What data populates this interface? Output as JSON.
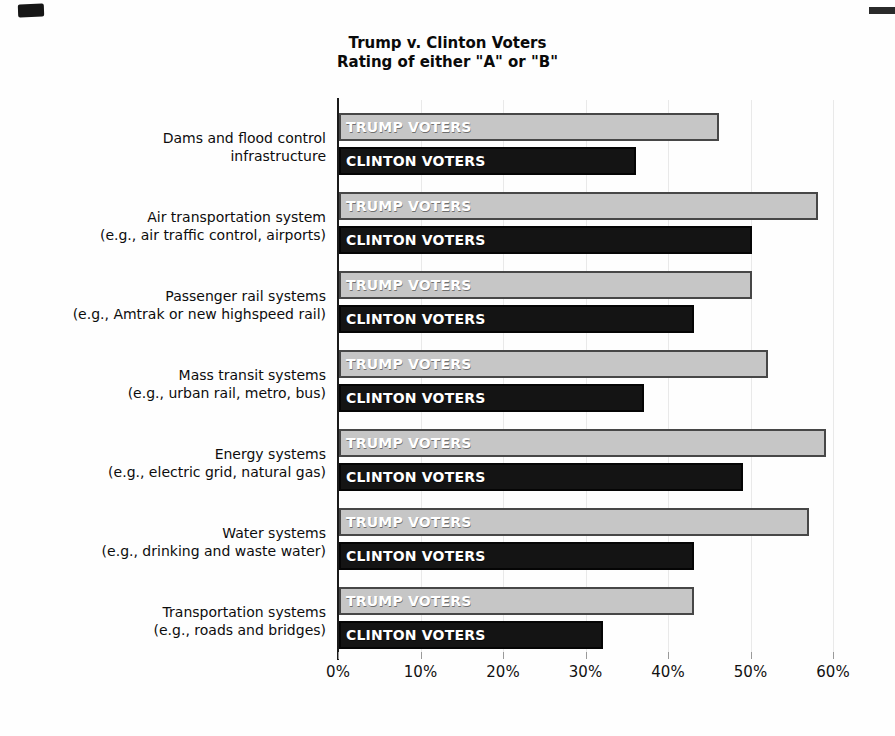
{
  "page": {
    "background": "#fefefe"
  },
  "chart_data": {
    "type": "bar",
    "orientation": "horizontal",
    "title": "Trump v. Clinton Voters",
    "subtitle": "Rating of either \"A\" or \"B\"",
    "xlabel": "",
    "ylabel": "",
    "xlim": [
      0,
      60
    ],
    "grid": "vertical-light",
    "legend_position": "in-bar-labels",
    "x_ticks": [
      {
        "value": 0,
        "label": "0%"
      },
      {
        "value": 10,
        "label": "10%"
      },
      {
        "value": 20,
        "label": "20%"
      },
      {
        "value": 30,
        "label": "30%"
      },
      {
        "value": 40,
        "label": "40%"
      },
      {
        "value": 50,
        "label": "50%"
      },
      {
        "value": 60,
        "label": "60%"
      }
    ],
    "categories": [
      {
        "line1": "Dams and flood control",
        "line2": "infrastructure"
      },
      {
        "line1": "Air transportation system",
        "line2": "(e.g., air traffic control, airports)"
      },
      {
        "line1": "Passenger rail systems",
        "line2": "(e.g., Amtrak or new highspeed rail)"
      },
      {
        "line1": "Mass transit systems",
        "line2": "(e.g., urban rail, metro, bus)"
      },
      {
        "line1": "Energy systems",
        "line2": "(e.g., electric grid, natural gas)"
      },
      {
        "line1": "Water systems",
        "line2": "(e.g., drinking and waste water)"
      },
      {
        "line1": "Transportation systems",
        "line2": "(e.g., roads and bridges)"
      }
    ],
    "series": [
      {
        "name": "TRUMP VOTERS",
        "color": "#c6c6c6",
        "border_color": "#474747",
        "text_color": "#ffffff",
        "values": [
          46,
          58,
          50,
          52,
          59,
          57,
          43
        ]
      },
      {
        "name": "CLINTON VOTERS",
        "color": "#141414",
        "border_color": "#050505",
        "text_color": "#ffffff",
        "values": [
          36,
          50,
          43,
          37,
          49,
          43,
          32
        ]
      }
    ]
  }
}
